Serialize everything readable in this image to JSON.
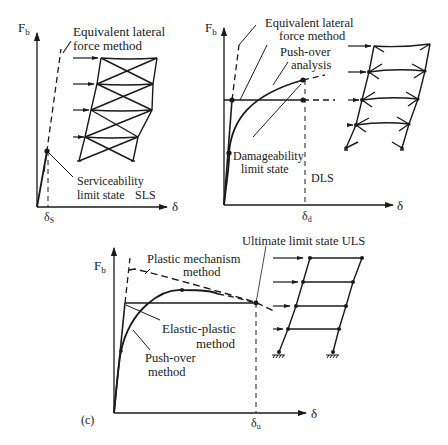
{
  "panels": {
    "a": {
      "y_axis_label": "Fb",
      "y_axis_label_main": "F",
      "y_axis_label_sub": "b",
      "x_axis_label": "δ",
      "x_tick_main": "δ",
      "x_tick_sub": "S",
      "method_label_line1": "Equivalent lateral",
      "method_label_line2": "force method",
      "state_label_line1": "Serviceability",
      "state_label_line2": "limit state",
      "state_abbr": "SLS",
      "frame_type": "braced frame (X-bracing), 4 storeys",
      "lateral_loads": 4
    },
    "b": {
      "y_axis_label_main": "F",
      "y_axis_label_sub": "b",
      "x_axis_label": "δ",
      "x_tick_main": "δ",
      "x_tick_sub": "d",
      "method_label_line1": "Equivalent lateral",
      "method_label_line2": "force method",
      "pushover_label_line1": "Push-over",
      "pushover_label_line2": "analysis",
      "state_label_line1": "Damageability",
      "state_label_line2": "limit state",
      "state_abbr": "DLS",
      "frame_type": "moment frame with plastic hinges, 4 storeys",
      "lateral_loads": 4
    },
    "c": {
      "panel_tag": "(c)",
      "y_axis_label_main": "F",
      "y_axis_label_sub": "b",
      "x_axis_label": "δ",
      "x_tick_main": "δ",
      "x_tick_sub": "u",
      "state_label": "Ultimate limit state ULS",
      "plastic_label_line1": "Plastic mechanism",
      "plastic_label_line2": "method",
      "elastic_plastic_line1": "Elastic-plastic",
      "elastic_plastic_line2": "method",
      "pushover_line1": "Push-over",
      "pushover_line2": "method",
      "frame_type": "sway frame with pinned supports, 4 storeys",
      "lateral_loads": 4
    }
  }
}
